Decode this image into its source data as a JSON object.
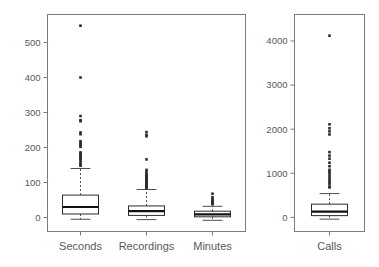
{
  "figure": {
    "width": 379,
    "height": 267,
    "background": "#ffffff",
    "axis_color": "#7b7b7d",
    "text_color": "#58585a",
    "box_color": "#2b2b2b",
    "median_color": "#111111",
    "outlier_color": "#2b2b2b"
  },
  "chart_data": {
    "type": "box",
    "title": "",
    "xlabel": "",
    "ylabel": "",
    "grid": false,
    "legend": "none",
    "panels": [
      {
        "name": "left-panel",
        "ylim": [
          -40,
          580
        ],
        "yticks": [
          0,
          100,
          200,
          300,
          400,
          500
        ],
        "ytick_labels": [
          "0",
          "100",
          "200",
          "300",
          "400",
          "500"
        ],
        "categories": [
          "Seconds",
          "Recordings",
          "Minutes"
        ],
        "boxes": [
          {
            "label": "Seconds",
            "min": -5,
            "q1": 10,
            "median": 30,
            "q3": 64,
            "max": 140,
            "outliers": [
              548,
              400,
              290,
              278,
              275,
              243,
              238,
              218,
              213,
              210,
              207,
              202,
              186,
              183,
              180,
              176,
              172,
              168,
              164,
              158,
              152,
              148
            ]
          },
          {
            "label": "Recordings",
            "min": -6,
            "q1": 6,
            "median": 18,
            "q3": 33,
            "max": 80,
            "outliers": [
              244,
              236,
              232,
              166,
              136,
              130,
              124,
              121,
              118,
              115,
              112,
              110,
              108,
              105,
              102,
              99,
              96,
              93,
              90,
              88,
              86,
              84
            ]
          },
          {
            "label": "Minutes",
            "min": -8,
            "q1": 2,
            "median": 9,
            "q3": 18,
            "max": 32,
            "outliers": [
              68,
              58,
              52,
              48,
              45,
              42,
              40,
              38
            ]
          }
        ]
      },
      {
        "name": "right-panel",
        "ylim": [
          -320,
          4600
        ],
        "yticks": [
          0,
          1000,
          2000,
          3000,
          4000
        ],
        "ytick_labels": [
          "0",
          "1000",
          "2000",
          "3000",
          "4000"
        ],
        "categories": [
          "Calls"
        ],
        "boxes": [
          {
            "label": "Calls",
            "min": -40,
            "q1": 40,
            "median": 130,
            "q3": 300,
            "max": 540,
            "outliers": [
              4120,
              2110,
              2020,
              1950,
              1880,
              1480,
              1400,
              1330,
              1240,
              1160,
              1080,
              1040,
              1000,
              950,
              900,
              850,
              800,
              760,
              700,
              680
            ]
          }
        ]
      }
    ]
  },
  "labels": {
    "seconds": "Seconds",
    "recordings": "Recordings",
    "minutes": "Minutes",
    "calls": "Calls"
  }
}
